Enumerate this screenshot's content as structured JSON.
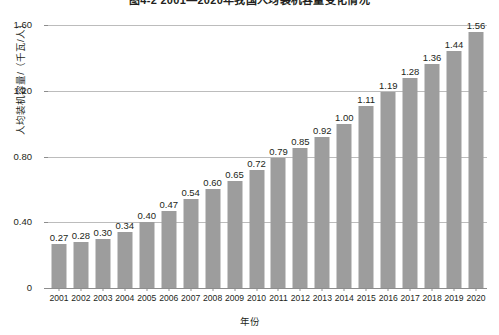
{
  "chart_data": {
    "type": "bar",
    "title": "图4-2  2001—2020年我国人均装机容量变化情况",
    "xlabel": "年份",
    "ylabel": "人均装机容量/（千瓦/人）",
    "categories": [
      "2001",
      "2002",
      "2003",
      "2004",
      "2005",
      "2006",
      "2007",
      "2008",
      "2009",
      "2010",
      "2011",
      "2012",
      "2013",
      "2014",
      "2015",
      "2016",
      "2017",
      "2018",
      "2019",
      "2020"
    ],
    "values": [
      0.27,
      0.28,
      0.3,
      0.34,
      0.4,
      0.47,
      0.54,
      0.6,
      0.65,
      0.72,
      0.79,
      0.85,
      0.92,
      1.0,
      1.11,
      1.19,
      1.28,
      1.36,
      1.44,
      1.56
    ],
    "value_labels": [
      "0.27",
      "0.28",
      "0.30",
      "0.34",
      "0.40",
      "0.47",
      "0.54",
      "0.60",
      "0.65",
      "0.72",
      "0.79",
      "0.85",
      "0.92",
      "1.00",
      "1.11",
      "1.19",
      "1.28",
      "1.36",
      "1.44",
      "1.56"
    ],
    "ylim": [
      0,
      1.6
    ],
    "yticks": [
      0,
      0.4,
      0.8,
      1.2,
      1.6
    ],
    "ytick_labels": [
      "0",
      "0.40",
      "0.80",
      "1.20",
      "1.60"
    ],
    "grid": true,
    "legend": "none",
    "series_color": "#9d9d9d",
    "gridline_color": "#bcbcbc",
    "axis_color": "#8d8d8d",
    "text_color": "#231f20",
    "background": "#ffffff"
  }
}
